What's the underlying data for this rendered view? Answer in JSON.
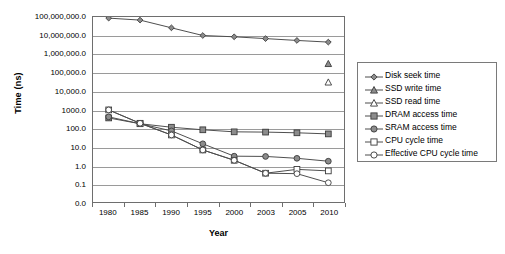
{
  "chart_data": {
    "type": "line",
    "title": "",
    "xlabel": "Year",
    "ylabel": "Time (ns)",
    "yscale": "log",
    "grid": true,
    "legend_position": "right",
    "categories": [
      "1980",
      "1985",
      "1990",
      "1995",
      "2000",
      "2003",
      "2005",
      "2010"
    ],
    "ytick_labels": [
      "100,000,000.0",
      "10,000,000.0",
      "1,000,000.0",
      "100,000.0",
      "10,000.0",
      "1000.0",
      "100.0",
      "10.0",
      "1.0",
      "0.1",
      "0.0"
    ],
    "ytick_values": [
      100000000,
      10000000,
      1000000,
      100000,
      10000,
      1000,
      100,
      10,
      1,
      0.1,
      0
    ],
    "series": [
      {
        "name": "Disk seek time",
        "marker": "filled-diamond",
        "values": [
          87000000,
          68000000,
          26000000,
          10000000,
          8500000,
          6800000,
          5400000,
          4400000
        ]
      },
      {
        "name": "SSD write time",
        "marker": "filled-triangle",
        "values": [
          null,
          null,
          null,
          null,
          null,
          null,
          null,
          300000
        ]
      },
      {
        "name": "SSD read time",
        "marker": "open-triangle",
        "values": [
          null,
          null,
          null,
          null,
          null,
          null,
          null,
          30000
        ]
      },
      {
        "name": "DRAM access time",
        "marker": "filled-square",
        "values": [
          350,
          170,
          110,
          80,
          62,
          60,
          55,
          48
        ]
      },
      {
        "name": "SRAM access time",
        "marker": "filled-circle",
        "values": [
          400,
          170,
          70,
          14,
          3.0,
          2.9,
          2.3,
          1.6
        ]
      },
      {
        "name": "CPU cycle time",
        "marker": "open-square",
        "values": [
          950,
          180,
          42,
          6.5,
          1.8,
          0.36,
          0.58,
          0.48
        ]
      },
      {
        "name": "Effective CPU cycle time",
        "marker": "open-circle",
        "values": [
          950,
          180,
          42,
          6.5,
          1.8,
          0.36,
          0.34,
          0.11
        ]
      }
    ]
  },
  "axis": {
    "ylabel": "Time (ns)",
    "xlabel": "Year"
  },
  "legend": {
    "items": [
      {
        "label": "Disk seek time",
        "marker": "filled-diamond"
      },
      {
        "label": "SSD write time",
        "marker": "filled-triangle"
      },
      {
        "label": "SSD read time",
        "marker": "open-triangle"
      },
      {
        "label": "DRAM access time",
        "marker": "filled-square"
      },
      {
        "label": "SRAM access time",
        "marker": "filled-circle"
      },
      {
        "label": "CPU cycle time",
        "marker": "open-square"
      },
      {
        "label": "Effective CPU cycle time",
        "marker": "open-circle"
      }
    ]
  },
  "colors": {
    "line": "#4d4d4d",
    "marker_fill": "#8c8c8c",
    "marker_stroke": "#3a3a3a",
    "grid": "#9a9a9a",
    "frame": "#6e6e6e",
    "background": "#ffffff"
  }
}
